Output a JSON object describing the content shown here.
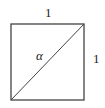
{
  "diagram": {
    "type": "unit-square-with-diagonal",
    "shapes": {
      "square": {
        "x": 11,
        "y": 24,
        "width": 73,
        "height": 76,
        "stroke": "#444444"
      },
      "diagonal": {
        "x1": 11,
        "y1": 100,
        "x2": 84,
        "y2": 24,
        "stroke": "#444444"
      }
    },
    "labels": {
      "top_side": "1",
      "right_side": "1",
      "angle": "α"
    }
  }
}
